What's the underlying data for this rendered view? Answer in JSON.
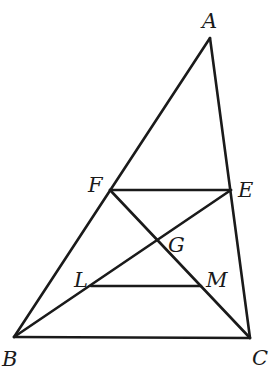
{
  "diagram": {
    "type": "geometry-triangle",
    "points": {
      "A": {
        "x": 210,
        "y": 38
      },
      "B": {
        "x": 14,
        "y": 337
      },
      "C": {
        "x": 250,
        "y": 338
      },
      "F": {
        "x": 110,
        "y": 190
      },
      "E": {
        "x": 231,
        "y": 190
      },
      "G": {
        "x": 157,
        "y": 240
      },
      "L": {
        "x": 91,
        "y": 286
      },
      "M": {
        "x": 201,
        "y": 286
      }
    },
    "segments": [
      [
        "A",
        "B"
      ],
      [
        "A",
        "C"
      ],
      [
        "B",
        "C"
      ],
      [
        "F",
        "E"
      ],
      [
        "F",
        "C"
      ],
      [
        "B",
        "E"
      ],
      [
        "L",
        "M"
      ]
    ],
    "labels": [
      {
        "text": "A",
        "x": 202,
        "y": 28
      },
      {
        "text": "F",
        "x": 88,
        "y": 192
      },
      {
        "text": "E",
        "x": 238,
        "y": 197
      },
      {
        "text": "G",
        "x": 168,
        "y": 252
      },
      {
        "text": "L",
        "x": 74,
        "y": 287
      },
      {
        "text": "M",
        "x": 206,
        "y": 287
      },
      {
        "text": "B",
        "x": 2,
        "y": 366
      },
      {
        "text": "C",
        "x": 252,
        "y": 365
      }
    ]
  }
}
